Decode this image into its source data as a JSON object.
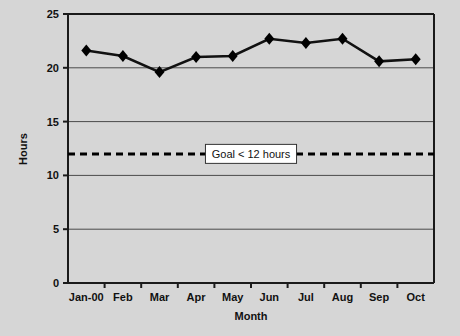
{
  "chart_data": {
    "type": "line",
    "title": "",
    "xlabel": "Month",
    "ylabel": "Hours",
    "categories": [
      "Jan-00",
      "Feb",
      "Mar",
      "Apr",
      "May",
      "Jun",
      "Jul",
      "Aug",
      "Sep",
      "Oct"
    ],
    "values": [
      21.6,
      21.1,
      19.6,
      21.0,
      21.1,
      22.7,
      22.3,
      22.7,
      20.6,
      20.8
    ],
    "series": [
      {
        "name": "Hours",
        "values": [
          21.6,
          21.1,
          19.6,
          21.0,
          21.1,
          22.7,
          22.3,
          22.7,
          20.6,
          20.8
        ]
      }
    ],
    "ylim": [
      0,
      25
    ],
    "yticks": [
      0,
      5,
      10,
      15,
      20,
      25
    ],
    "ytick_labels": [
      "0",
      "5",
      "10",
      "15",
      "20",
      "25"
    ],
    "grid": true,
    "grid_axis": "y",
    "legend": "none",
    "marker": "diamond",
    "line_color": "#000000",
    "marker_color": "#000000",
    "plot_background": "#d6d6d6",
    "figure_background": "#d6d6d6",
    "gridline_color": "#4a4a4a",
    "axis_color": "#1a1a1a",
    "annotations": [
      {
        "name": "goal-line",
        "type": "hline",
        "value": 12,
        "style": "dashed",
        "color": "#000000",
        "label": "Goal < 12 hours",
        "label_background": "#ffffff",
        "label_border": "#333333"
      }
    ]
  },
  "axes": {
    "y_title": "Hours",
    "x_title": "Month"
  }
}
